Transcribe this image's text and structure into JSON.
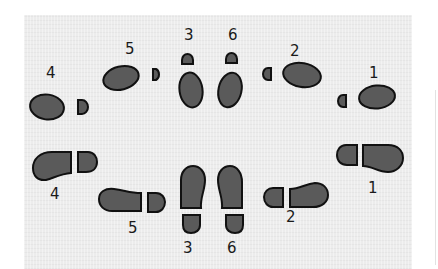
{
  "diagram": {
    "colors": {
      "paper": "#ececec",
      "print_fill": "#5a5a5a",
      "print_stroke": "#111111",
      "label": "#1a1a1a"
    },
    "top_row": {
      "description": "Lady's steps (oval sole with small heel)",
      "steps": [
        {
          "label": "4"
        },
        {
          "label": "5"
        },
        {
          "label": "3"
        },
        {
          "label": "6"
        },
        {
          "label": "2"
        },
        {
          "label": "1"
        }
      ]
    },
    "bottom_row": {
      "description": "Man's steps (shoe sole with heel)",
      "steps": [
        {
          "label": "4"
        },
        {
          "label": "5"
        },
        {
          "label": "3"
        },
        {
          "label": "6"
        },
        {
          "label": "2"
        },
        {
          "label": "1"
        }
      ]
    }
  }
}
